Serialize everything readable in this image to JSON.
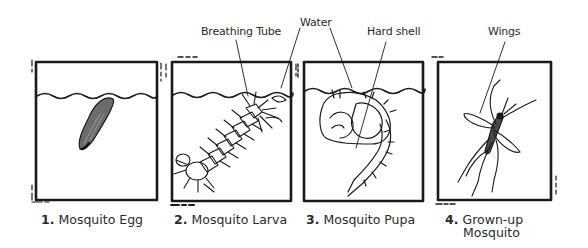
{
  "diagram": {
    "type": "life-cycle",
    "callouts": [
      {
        "id": "breathing-tube",
        "label": "Breathing Tube",
        "points_to": "stage-2"
      },
      {
        "id": "water",
        "label": "Water",
        "points_to": [
          "stage-2",
          "stage-3"
        ]
      },
      {
        "id": "hard-shell",
        "label": "Hard shell",
        "points_to": "stage-3"
      },
      {
        "id": "wings",
        "label": "Wings",
        "points_to": "stage-4"
      }
    ],
    "stages": [
      {
        "number": "1.",
        "label": "Mosquito Egg",
        "label_line2": ""
      },
      {
        "number": "2.",
        "label": "Mosquito Larva",
        "label_line2": ""
      },
      {
        "number": "3.",
        "label": "Mosquito Pupa",
        "label_line2": ""
      },
      {
        "number": "4.",
        "label": "Grown-up",
        "label_line2": "Mosquito"
      }
    ],
    "colors": {
      "ink": "#1a1a1a",
      "background": "#ffffff"
    }
  }
}
